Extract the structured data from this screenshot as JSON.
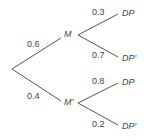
{
  "tree": {
    "root": {
      "x": 12,
      "y": 69
    },
    "first_level": [
      {
        "node": "M",
        "prob": "0.6",
        "children": [
          {
            "node": "DP",
            "prob": "0.3"
          },
          {
            "node": "DP'",
            "prob": "0.7"
          }
        ]
      },
      {
        "node": "M'",
        "prob": "0.4",
        "children": [
          {
            "node": "DP",
            "prob": "0.8"
          },
          {
            "node": "DP'",
            "prob": "0.2"
          }
        ]
      }
    ]
  },
  "labels": {
    "m": "M",
    "m_prime": "M'",
    "p_m": "0.6",
    "p_m_prime": "0.4",
    "p_dp_m": "0.3",
    "p_dpp_m": "0.7",
    "p_dp_mp": "0.8",
    "p_dpp_mp": "0.2",
    "dp_1": "DP",
    "dpp_1": "DP'",
    "dp_2": "DP",
    "dpp_2": "DP'"
  },
  "colors": {
    "line": "#555555",
    "text": "#444444"
  }
}
